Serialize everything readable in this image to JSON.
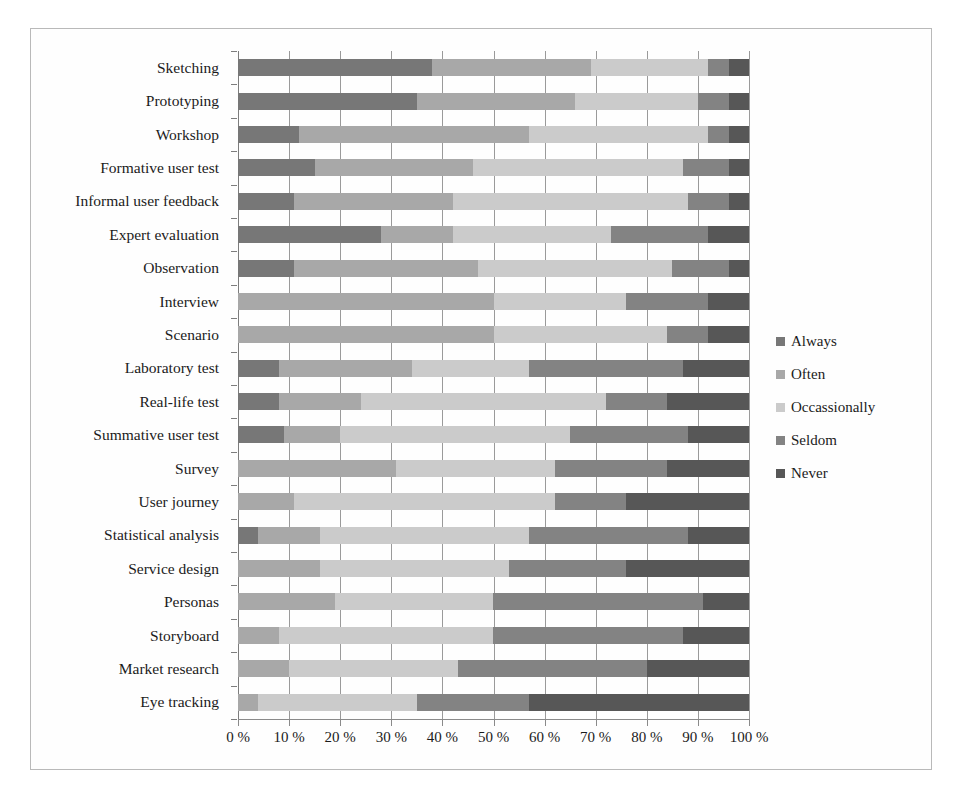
{
  "chart_data": {
    "type": "bar",
    "subtype": "horizontal-stacked-100",
    "title": "",
    "xlabel": "",
    "ylabel": "",
    "xlim": [
      0,
      100
    ],
    "xticks": [
      "0 %",
      "10 %",
      "20 %",
      "30 %",
      "40 %",
      "50 %",
      "60 %",
      "70 %",
      "80 %",
      "90 %",
      "100 %"
    ],
    "xtick_values": [
      0,
      10,
      20,
      30,
      40,
      50,
      60,
      70,
      80,
      90,
      100
    ],
    "grid": true,
    "legend_position": "right",
    "categories": [
      "Sketching",
      "Prototyping",
      "Workshop",
      "Formative user test",
      "Informal user feedback",
      "Expert evaluation",
      "Observation",
      "Interview",
      "Scenario",
      "Laboratory test",
      "Real-life test",
      "Summative user test",
      "Survey",
      "User journey",
      "Statistical analysis",
      "Service design",
      "Personas",
      "Storyboard",
      "Market research",
      "Eye tracking"
    ],
    "series": [
      {
        "name": "Always",
        "color": "#777777",
        "values": [
          38,
          35,
          12,
          15,
          11,
          28,
          11,
          0,
          0,
          8,
          8,
          9,
          0,
          0,
          4,
          0,
          0,
          0,
          0,
          0
        ]
      },
      {
        "name": "Often",
        "color": "#a8a8a8",
        "values": [
          31,
          31,
          45,
          31,
          31,
          14,
          36,
          50,
          50,
          26,
          16,
          11,
          31,
          11,
          12,
          16,
          19,
          8,
          10,
          4
        ]
      },
      {
        "name": "Occassionally",
        "color": "#cbcbcb",
        "values": [
          23,
          24,
          35,
          41,
          46,
          31,
          38,
          26,
          34,
          23,
          48,
          45,
          31,
          51,
          41,
          37,
          31,
          42,
          33,
          31
        ]
      },
      {
        "name": "Seldom",
        "color": "#838383",
        "values": [
          4,
          6,
          4,
          9,
          8,
          19,
          11,
          16,
          8,
          30,
          12,
          23,
          22,
          14,
          31,
          23,
          41,
          37,
          37,
          22
        ]
      },
      {
        "name": "Never",
        "color": "#575757",
        "values": [
          4,
          4,
          4,
          4,
          4,
          8,
          4,
          8,
          8,
          13,
          16,
          12,
          16,
          24,
          12,
          24,
          9,
          13,
          20,
          43
        ]
      }
    ]
  },
  "legend": {
    "items": [
      {
        "label": "Always",
        "color": "#777777"
      },
      {
        "label": "Often",
        "color": "#a8a8a8"
      },
      {
        "label": "Occassionally",
        "color": "#cbcbcb"
      },
      {
        "label": "Seldom",
        "color": "#838383"
      },
      {
        "label": "Never",
        "color": "#575757"
      }
    ]
  }
}
